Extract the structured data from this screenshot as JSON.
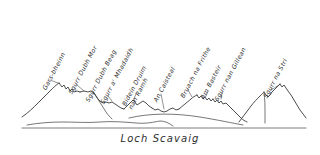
{
  "drawing": {
    "title": "Cuillin Ridge panorama from Loch Scavaig",
    "medium": "pen-and-ink sketch",
    "caption": "Loch Scavaig",
    "ink_color": "#3a3a3a",
    "paper_color": "#ffffff"
  },
  "peaks": [
    {
      "id": "gars-bheinn",
      "label_lines": [
        "Gars-bheinn"
      ],
      "order": 1,
      "x": 47,
      "y": 84,
      "rotation": -62
    },
    {
      "id": "sgurr-dubh-mor",
      "label_lines": [
        "Sgurr Dubh Mor"
      ],
      "order": 2,
      "x": 73,
      "y": 88,
      "rotation": -62
    },
    {
      "id": "sgurr-dubh-beag",
      "label_lines": [
        "Sgurr Dubh Beag"
      ],
      "order": 3,
      "x": 90,
      "y": 96,
      "rotation": -62
    },
    {
      "id": "sgurr-a-mhadaidh",
      "label_lines": [
        "Sgurr a' Mhadaidh"
      ],
      "order": 4,
      "x": 105,
      "y": 98,
      "rotation": -62
    },
    {
      "id": "bidein-druim-nan-ramh",
      "label_lines": [
        "Bidein Druim",
        "nan Ramh"
      ],
      "order": 5,
      "x": 133,
      "y": 96,
      "rotation": -62
    },
    {
      "id": "an-caisteal",
      "label_lines": [
        "An Caisteal"
      ],
      "order": 6,
      "x": 158,
      "y": 96,
      "rotation": -62
    },
    {
      "id": "bruach-na-frithe",
      "label_lines": [
        "Bruach na Frithe"
      ],
      "order": 7,
      "x": 185,
      "y": 92,
      "rotation": -62
    },
    {
      "id": "am-basteir",
      "label_lines": [
        "Am Basteir"
      ],
      "order": 8,
      "x": 205,
      "y": 93,
      "rotation": -62
    },
    {
      "id": "sgurr-nan-gillean",
      "label_lines": [
        "Sgurr nan Gillean"
      ],
      "order": 9,
      "x": 219,
      "y": 95,
      "rotation": -62
    },
    {
      "id": "sgurr-na-stri",
      "label_lines": [
        "Sgurr na Stri"
      ],
      "order": 10,
      "x": 268,
      "y": 92,
      "rotation": -62
    }
  ],
  "caption": {
    "text": "Loch Scavaig",
    "top": 133
  },
  "geometry": {
    "ridge_path": "M 22 116 L 29 111 L 34 106 L 39 101 L 44 96 L 48 92 L 52 89 L 56 86 L 59 84 L 62 87 L 64 90 L 66 87 L 68 90 L 70 93 L 73 91 L 75 93 L 78 92 L 82 92 L 86 92 L 90 92 L 93 93 L 95 96 L 97 99 L 99 101 L 102 103 L 105 104 L 108 103 L 111 102 L 113 103 L 116 104 L 118 107 L 120 110 L 123 113 L 126 116 L 129 118",
    "ridge_path_2": "M 126 104 L 129 102 L 131 100 L 133 99 L 136 101 L 138 103 L 141 102 L 143 100 L 145 99 L 148 101 L 151 103 L 154 104 L 157 106 L 160 108 L 163 110 L 166 111 L 169 110 L 172 108 L 175 107 L 178 109 L 181 107 L 184 106 L 186 104 L 188 103 L 190 101 L 192 99 L 194 97 L 196 96 L 198 98 L 200 100 L 202 99 L 204 97 L 206 99 L 208 101 L 210 100 L 212 98 L 214 100 L 216 102 L 218 100 L 220 98 L 222 100 L 224 102 L 226 101 L 228 103 L 231 105 L 234 107 L 237 109 L 240 111 L 243 113 L 246 115 L 249 117",
    "right_massif_path": "M 240 120 L 244 116 L 248 111 L 252 106 L 256 101 L 259 98 L 262 96 L 264 94 L 266 96 L 268 98 L 270 97 L 272 94 L 274 91 L 276 88 L 278 86 L 280 84 L 282 86 L 284 88 L 286 87 L 288 89 L 290 92 L 293 96 L 296 101 L 299 106 L 302 110 L 305 114 L 308 117",
    "shore_path": "M 28 125 L 40 123 L 55 122 L 70 122 L 85 123 L 100 122 L 115 122 L 130 123 L 145 122 L 158 121 L 165 123 L 170 125 L 175 126",
    "baseline_y": 128,
    "baseline_x1": 22,
    "baseline_x2": 306
  }
}
